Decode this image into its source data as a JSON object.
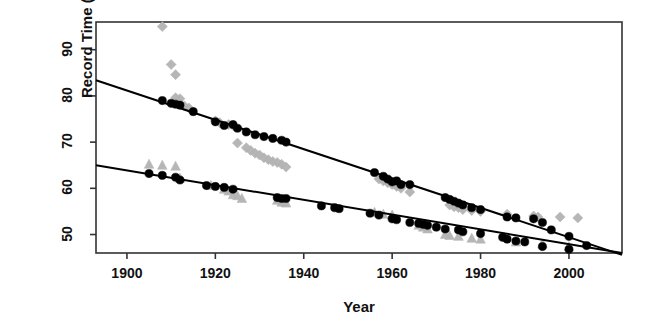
{
  "chart_data": {
    "type": "scatter",
    "title": "",
    "xlabel": "Year",
    "ylabel": "Record Time (secs)",
    "xlim": [
      1893,
      2012
    ],
    "ylim": [
      46,
      96
    ],
    "xticks": [
      1900,
      1920,
      1940,
      1960,
      1980,
      2000
    ],
    "xtick_labels": [
      "1900",
      "1920",
      "1940",
      "1960",
      "1980",
      "2000"
    ],
    "yticks": [
      50,
      60,
      70,
      80,
      90
    ],
    "ytick_labels": [
      "50",
      "60",
      "70",
      "80",
      "90"
    ],
    "grid": false,
    "legend": "none",
    "frame": true,
    "colors": {
      "record_marker": "#000000",
      "fit_line": "#000000",
      "secondary_marker": "#b3b3b3",
      "axis": "#333333",
      "background": "#ffffff"
    },
    "series": [
      {
        "name": "Series A records",
        "marker": "filled-circle",
        "color": "#000000",
        "points": [
          [
            1908,
            79.0
          ],
          [
            1910,
            78.4
          ],
          [
            1911,
            78.2
          ],
          [
            1912,
            78.0
          ],
          [
            1915,
            76.6
          ],
          [
            1920,
            74.4
          ],
          [
            1922,
            73.6
          ],
          [
            1924,
            73.8
          ],
          [
            1925,
            73.0
          ],
          [
            1927,
            72.2
          ],
          [
            1929,
            71.6
          ],
          [
            1931,
            71.2
          ],
          [
            1933,
            70.8
          ],
          [
            1935,
            70.4
          ],
          [
            1936,
            70.0
          ],
          [
            1956,
            63.4
          ],
          [
            1958,
            62.6
          ],
          [
            1959,
            62.0
          ],
          [
            1960,
            61.4
          ],
          [
            1961,
            61.6
          ],
          [
            1962,
            60.8
          ],
          [
            1964,
            60.8
          ],
          [
            1972,
            58.0
          ],
          [
            1973,
            57.6
          ],
          [
            1974,
            57.2
          ],
          [
            1975,
            56.8
          ],
          [
            1976,
            56.4
          ],
          [
            1978,
            55.8
          ],
          [
            1980,
            55.4
          ],
          [
            1986,
            53.8
          ],
          [
            1988,
            53.6
          ],
          [
            1992,
            53.4
          ],
          [
            1994,
            52.6
          ],
          [
            1996,
            51.0
          ],
          [
            2000,
            49.6
          ],
          [
            2004,
            47.6
          ]
        ]
      },
      {
        "name": "Series B records",
        "marker": "filled-circle",
        "color": "#000000",
        "points": [
          [
            1905,
            63.2
          ],
          [
            1908,
            62.8
          ],
          [
            1911,
            62.4
          ],
          [
            1912,
            61.8
          ],
          [
            1918,
            60.6
          ],
          [
            1920,
            60.4
          ],
          [
            1922,
            60.2
          ],
          [
            1924,
            59.8
          ],
          [
            1934,
            58.0
          ],
          [
            1935,
            57.8
          ],
          [
            1936,
            57.8
          ],
          [
            1944,
            56.2
          ],
          [
            1947,
            55.8
          ],
          [
            1948,
            55.6
          ],
          [
            1955,
            54.6
          ],
          [
            1957,
            54.2
          ],
          [
            1960,
            53.4
          ],
          [
            1961,
            53.2
          ],
          [
            1964,
            52.6
          ],
          [
            1966,
            52.4
          ],
          [
            1967,
            52.2
          ],
          [
            1968,
            52.0
          ],
          [
            1970,
            51.6
          ],
          [
            1972,
            51.2
          ],
          [
            1975,
            51.0
          ],
          [
            1976,
            50.6
          ],
          [
            1980,
            50.2
          ],
          [
            1985,
            49.4
          ],
          [
            1986,
            49.0
          ],
          [
            1988,
            48.6
          ],
          [
            1990,
            48.4
          ],
          [
            1994,
            47.4
          ],
          [
            2000,
            46.8
          ]
        ]
      },
      {
        "name": "Series A non-record performances",
        "marker": "diamond",
        "color": "#b3b3b3",
        "points": [
          [
            1908,
            95.0
          ],
          [
            1910,
            86.8
          ],
          [
            1911,
            84.6
          ],
          [
            1911,
            79.6
          ],
          [
            1912,
            79.4
          ],
          [
            1913,
            77.8
          ],
          [
            1914,
            77.4
          ],
          [
            1920,
            74.6
          ],
          [
            1921,
            74.2
          ],
          [
            1923,
            73.8
          ],
          [
            1924,
            73.6
          ],
          [
            1925,
            69.8
          ],
          [
            1927,
            68.8
          ],
          [
            1928,
            68.2
          ],
          [
            1929,
            67.6
          ],
          [
            1930,
            67.2
          ],
          [
            1931,
            66.6
          ],
          [
            1932,
            66.2
          ],
          [
            1933,
            65.8
          ],
          [
            1934,
            65.6
          ],
          [
            1935,
            65.2
          ],
          [
            1936,
            64.6
          ],
          [
            1957,
            62.0
          ],
          [
            1958,
            61.6
          ],
          [
            1959,
            61.2
          ],
          [
            1960,
            60.8
          ],
          [
            1961,
            60.4
          ],
          [
            1962,
            60.0
          ],
          [
            1964,
            59.2
          ],
          [
            1973,
            56.4
          ],
          [
            1974,
            56.0
          ],
          [
            1975,
            55.8
          ],
          [
            1976,
            55.4
          ],
          [
            1978,
            55.2
          ],
          [
            1980,
            55.0
          ],
          [
            1986,
            54.4
          ],
          [
            1992,
            54.0
          ],
          [
            1993,
            53.8
          ],
          [
            1998,
            53.8
          ],
          [
            2002,
            53.6
          ]
        ]
      },
      {
        "name": "Series B non-record performances",
        "marker": "triangle",
        "color": "#b3b3b3",
        "points": [
          [
            1905,
            65.2
          ],
          [
            1908,
            65.0
          ],
          [
            1911,
            64.8
          ],
          [
            1912,
            62.2
          ],
          [
            1919,
            60.6
          ],
          [
            1922,
            59.8
          ],
          [
            1923,
            59.4
          ],
          [
            1924,
            58.6
          ],
          [
            1925,
            58.4
          ],
          [
            1926,
            57.8
          ],
          [
            1934,
            57.4
          ],
          [
            1935,
            57.0
          ],
          [
            1936,
            56.8
          ],
          [
            1956,
            54.8
          ],
          [
            1958,
            54.4
          ],
          [
            1960,
            54.2
          ],
          [
            1966,
            52.0
          ],
          [
            1967,
            51.6
          ],
          [
            1968,
            51.2
          ],
          [
            1972,
            50.0
          ],
          [
            1973,
            49.8
          ],
          [
            1975,
            49.6
          ],
          [
            1978,
            49.2
          ],
          [
            1980,
            49.0
          ],
          [
            1988,
            48.4
          ],
          [
            1994,
            48.0
          ],
          [
            2000,
            47.4
          ]
        ]
      }
    ],
    "fit_lines": [
      {
        "name": "Series A trend",
        "from": [
          1893,
          83.4
        ],
        "to": [
          2012,
          45.6
        ],
        "color": "#000000",
        "width": 2
      },
      {
        "name": "Series B trend",
        "from": [
          1893,
          65.0
        ],
        "to": [
          2012,
          46.0
        ],
        "color": "#000000",
        "width": 2
      }
    ]
  }
}
